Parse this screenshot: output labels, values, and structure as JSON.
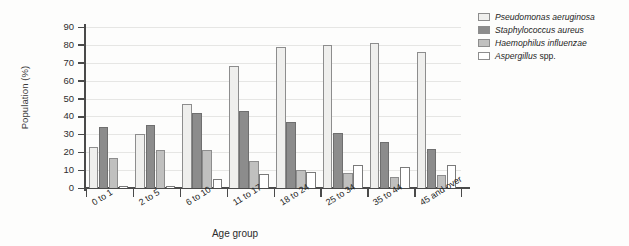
{
  "chart_data": {
    "type": "bar",
    "title": "",
    "xlabel": "Age group",
    "ylabel": "Population (%)",
    "ylim": [
      0,
      90
    ],
    "ytick_step": 10,
    "grid": true,
    "legend_position": "right",
    "categories": [
      "0 to 1",
      "2 to 5",
      "6 to 10",
      "11 to 17",
      "18 to 24",
      "25 to 34",
      "35 to 44",
      "45 and over"
    ],
    "yticks": [
      "0",
      "10",
      "20",
      "30",
      "40",
      "50",
      "60",
      "70",
      "80",
      "90"
    ],
    "series": [
      {
        "name": "Pseudomonas aeruginosa",
        "name_italic": "Pseudomonas aeruginosa",
        "name_suffix": "",
        "color": "#efefed",
        "values": [
          23,
          30,
          47,
          68,
          79,
          80,
          81,
          76
        ]
      },
      {
        "name": "Staphylococcus aureus",
        "name_italic": "Staphylococcus aureus",
        "name_suffix": "",
        "color": "#8c8c8c",
        "values": [
          34,
          35,
          42,
          43,
          37,
          31,
          26,
          22
        ]
      },
      {
        "name": "Haemophilus influenzae",
        "name_italic": "Haemophilus influenzae",
        "name_suffix": "",
        "color": "#c0c0bf",
        "values": [
          17,
          21,
          21,
          15,
          10,
          8.5,
          6,
          7
        ]
      },
      {
        "name": "Aspergillus spp.",
        "name_italic": "Aspergillus",
        "name_suffix": " spp.",
        "color": "#ffffff",
        "values": [
          1,
          1,
          5,
          8,
          9,
          13,
          12,
          13
        ]
      }
    ]
  }
}
